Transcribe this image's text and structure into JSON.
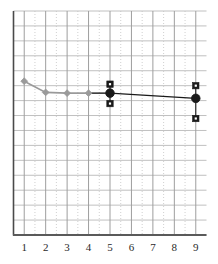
{
  "chart_data": {
    "type": "line",
    "title": "",
    "subtitle": "",
    "xlabel": "",
    "ylabel": "",
    "xlim": [
      0.5,
      9.5
    ],
    "ylim": [
      0,
      15
    ],
    "grid": true,
    "grid_horizontal_lines": 15,
    "legend": "none",
    "xticks": [
      1,
      2,
      3,
      4,
      5,
      6,
      7,
      8,
      9
    ],
    "xtick_labels": [
      "1",
      "2",
      "3",
      "4",
      "5",
      "6",
      "7",
      "8",
      "9"
    ],
    "ytick_labels": [],
    "series": [
      {
        "name": "gray-series",
        "color": "#9a9a9a",
        "marker": "diamond",
        "line_style": "solid",
        "x": [
          1,
          2,
          3,
          4
        ],
        "values": [
          10.3,
          9.55,
          9.5,
          9.5
        ]
      },
      {
        "name": "black-series",
        "color": "#1a1a1a",
        "marker": "circle",
        "line_style": "solid",
        "x": [
          5,
          9
        ],
        "values": [
          9.5,
          9.15
        ],
        "error_bars": {
          "marker": "square",
          "upper": [
            10.1,
            10.0
          ],
          "lower": [
            8.8,
            7.8
          ]
        }
      }
    ],
    "annotations": []
  },
  "axes": {
    "x_axis_name": "x-axis",
    "y_axis_name": "y-axis"
  }
}
